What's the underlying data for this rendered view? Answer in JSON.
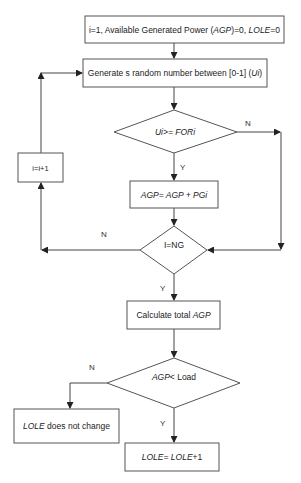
{
  "flowchart": {
    "nodes": {
      "init": {
        "type": "process",
        "parts": [
          {
            "t": "i=1, Available Generated Power (",
            "i": false
          },
          {
            "t": "AGP",
            "i": true
          },
          {
            "t": ")=0, ",
            "i": false
          },
          {
            "t": "LOLE",
            "i": true
          },
          {
            "t": "=0",
            "i": false
          }
        ]
      },
      "generate": {
        "type": "process",
        "parts": [
          {
            "t": "Generate s random number between [0-1] (",
            "i": false
          },
          {
            "t": "Ui",
            "i": true
          },
          {
            "t": ")",
            "i": false
          }
        ]
      },
      "compare_for": {
        "type": "decision",
        "parts": [
          {
            "t": "Ui>= FORi",
            "i": true
          }
        ]
      },
      "accumulate": {
        "type": "process",
        "parts": [
          {
            "t": "AGP= AGP + PGi",
            "i": true
          }
        ]
      },
      "increment": {
        "type": "process",
        "parts": [
          {
            "t": "i=i+1",
            "i": false
          }
        ]
      },
      "check_ng": {
        "type": "decision",
        "parts": [
          {
            "t": "I=NG",
            "i": false
          }
        ]
      },
      "total": {
        "type": "process",
        "parts": [
          {
            "t": "Calculate total ",
            "i": false
          },
          {
            "t": "AGP",
            "i": true
          }
        ]
      },
      "compare_load": {
        "type": "decision",
        "parts": [
          {
            "t": "AGP",
            "i": true
          },
          {
            "t": "< Load",
            "i": false
          }
        ]
      },
      "no_change": {
        "type": "process",
        "parts": [
          {
            "t": "LOLE",
            "i": true
          },
          {
            "t": " does not change",
            "i": false
          }
        ]
      },
      "lole_inc": {
        "type": "process",
        "parts": [
          {
            "t": "LOLE=  LOLE",
            "i": true
          },
          {
            "t": "+1",
            "i": false
          }
        ]
      }
    },
    "edge_labels": {
      "for_no": "N",
      "for_yes": "Y",
      "ng_no": "N",
      "ng_yes": "Y",
      "load_no": "N",
      "load_yes": "Y"
    }
  }
}
